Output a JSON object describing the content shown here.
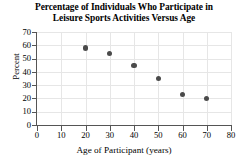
{
  "chart_data": {
    "type": "scatter",
    "title": "Percentage of Individuals Who Participate in Leisure Sports Activities Versus Age",
    "title_lines": [
      "Percentage of Individuals Who Participate in",
      "Leisure Sports Activities Versus Age"
    ],
    "xlabel": "Age of Participant (years)",
    "ylabel": "Percent",
    "x": [
      20,
      30,
      40,
      50,
      60,
      70
    ],
    "values": [
      58,
      54,
      45,
      35,
      23,
      20
    ],
    "points": [
      {
        "x": 20,
        "y": 58
      },
      {
        "x": 30,
        "y": 54
      },
      {
        "x": 40,
        "y": 45
      },
      {
        "x": 50,
        "y": 35
      },
      {
        "x": 60,
        "y": 23
      },
      {
        "x": 70,
        "y": 20
      }
    ],
    "xlim": [
      0,
      80
    ],
    "ylim": [
      0,
      70
    ],
    "xticks": [
      0,
      10,
      20,
      30,
      40,
      50,
      60,
      70,
      80
    ],
    "yticks": [
      0,
      10,
      20,
      30,
      40,
      50,
      60,
      70
    ],
    "grid": true,
    "legend": false,
    "marker_color": "#4a4a4a",
    "grid_color": "#e6e6e6",
    "axis_color": "#555555",
    "background": "#ffffff"
  }
}
